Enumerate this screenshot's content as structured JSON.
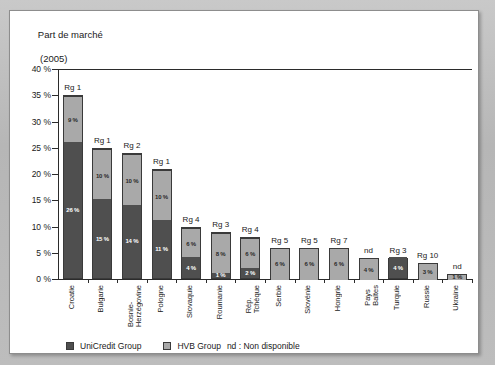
{
  "title": {
    "line1": "Part de marché",
    "line2": "(2005)"
  },
  "legend": {
    "unicredit_label": "UniCredit Group",
    "hvb_label": "HVB Group",
    "nd_note": "nd : Non disponible",
    "colors": {
      "unicredit": "#4f4f4f",
      "hvb": "#a9a9a9"
    }
  },
  "axis": {
    "y_ticks": [
      "40 %",
      "35 %",
      "30 %",
      "25 %",
      "20 %",
      "15 %",
      "10 %",
      "5 %",
      "0 %"
    ],
    "y_values": [
      40,
      35,
      30,
      25,
      20,
      15,
      10,
      5,
      0
    ]
  },
  "chart_data": {
    "type": "bar",
    "stacked": true,
    "title": "Part de marché (2005)",
    "xlabel": "",
    "ylabel": "",
    "ylim": [
      0,
      40
    ],
    "ytick_step": 5,
    "grid": false,
    "legend_position": "bottom",
    "categories": [
      "Croatie",
      "Bulgarie",
      "Bosnie-\nHerzégovine",
      "Pologne",
      "Slovaquie",
      "Roumanie",
      "Rép.\nTchèque",
      "Serbie",
      "Slovénie",
      "Hongrie",
      "Pays\nBaltes",
      "Turquie",
      "Russie",
      "Ukraine"
    ],
    "series": [
      {
        "name": "UniCredit Group",
        "color": "#4f4f4f",
        "values": [
          26,
          15,
          14,
          11,
          4,
          1,
          2,
          0,
          0,
          0,
          0,
          4,
          0,
          0
        ],
        "labels": [
          "26 %",
          "15 %",
          "14 %",
          "11 %",
          "4 %",
          "1 %",
          "2 %",
          "",
          "",
          "",
          "",
          "4 %",
          "",
          ""
        ]
      },
      {
        "name": "HVB Group",
        "color": "#a9a9a9",
        "values": [
          9,
          10,
          10,
          10,
          6,
          8,
          6,
          6,
          6,
          6,
          4,
          0,
          3,
          1
        ],
        "labels": [
          "9 %",
          "10 %",
          "10 %",
          "10 %",
          "6 %",
          "8 %",
          "6 %",
          "6 %",
          "6 %",
          "6 %",
          "4 %",
          "",
          "3 %",
          "1 %"
        ]
      }
    ],
    "totals": [
      35,
      25,
      24,
      21,
      10,
      9,
      8,
      6,
      6,
      6,
      4,
      4,
      3,
      1
    ],
    "rank_annotations": [
      "Rg 1",
      "Rg 1",
      "Rg 2",
      "Rg 1",
      "Rg 4",
      "Rg 3",
      "Rg 4",
      "Rg 5",
      "Rg 5",
      "Rg 7",
      "nd",
      "Rg 3",
      "Rg 10",
      "nd"
    ]
  }
}
